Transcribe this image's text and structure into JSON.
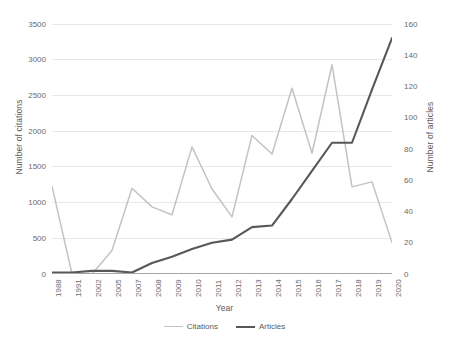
{
  "chart_data": {
    "type": "line",
    "title": "",
    "xlabel": "Year",
    "ylabel": "Number of citations",
    "ylabel_secondary": "Number of articles",
    "grid": true,
    "legend_position": "bottom",
    "categories": [
      "1988",
      "1991",
      "2002",
      "2005",
      "2007",
      "2008",
      "2009",
      "2010",
      "2011",
      "2012",
      "2013",
      "2014",
      "2015",
      "2016",
      "2017",
      "2018",
      "2019",
      "2020"
    ],
    "ylim": [
      0,
      3500
    ],
    "ylim_secondary": [
      0,
      160
    ],
    "yticks": [
      "0",
      "500",
      "1000",
      "1500",
      "2000",
      "2500",
      "3000",
      "3500"
    ],
    "yticks_secondary": [
      "0",
      "20",
      "40",
      "60",
      "80",
      "100",
      "120",
      "140",
      "160"
    ],
    "series": [
      {
        "name": "Citations",
        "axis": "left",
        "color": "#C3C3C3",
        "values": [
          1230,
          0,
          0,
          330,
          1200,
          940,
          830,
          1780,
          1190,
          800,
          1940,
          1680,
          2600,
          1690,
          2930,
          1220,
          1290,
          440
        ]
      },
      {
        "name": "Articles",
        "axis": "right",
        "color": "#585858",
        "values": [
          1,
          1,
          2,
          2,
          1,
          7,
          11,
          16,
          20,
          22,
          30,
          31,
          48,
          66,
          84,
          84,
          118,
          151
        ]
      }
    ]
  },
  "legend": {
    "entries": [
      {
        "label": "Citations"
      },
      {
        "label": "Articles"
      }
    ]
  }
}
